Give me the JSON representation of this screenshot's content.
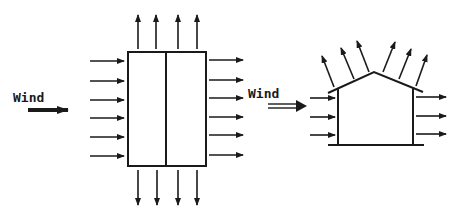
{
  "diagram": {
    "colors": {
      "ink": "#1a1a1a",
      "background": "#ffffff"
    },
    "plan_view": {
      "wind_label": "Wind",
      "building_rect": {
        "x": 128,
        "y": 52,
        "w": 78,
        "h": 114,
        "divider_x": 166
      },
      "inflow_arrows_count": 6,
      "outflow_right_arrows_count": 6,
      "up_arrows_count": 4,
      "down_arrows_count": 4
    },
    "section_view": {
      "wind_label": "Wind",
      "inflow_arrows_count": 3,
      "outflow_right_arrows_count": 3,
      "roof_suction_arrows_count": 6
    }
  }
}
